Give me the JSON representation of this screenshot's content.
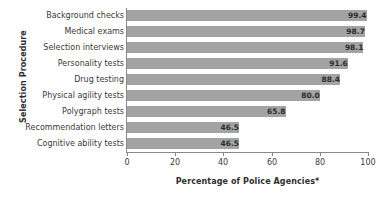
{
  "chart_data": {
    "type": "bar",
    "orientation": "horizontal",
    "title": "",
    "xlabel": "Percentage of Police Agencies*",
    "ylabel": "Selection Procedure",
    "xlim": [
      0,
      100
    ],
    "xticks": [
      "0",
      "20",
      "40",
      "60",
      "80",
      "100"
    ],
    "xtick_values": [
      0,
      20,
      40,
      60,
      80,
      100
    ],
    "grid": false,
    "legend": null,
    "bar_color": "#a3a3a3",
    "axis_color": "#888888",
    "categories": [
      "Background checks",
      "Medical exams",
      "Selection interviews",
      "Personality tests",
      "Drug testing",
      "Physical agility tests",
      "Polygraph tests",
      "Recommendation letters",
      "Cognitive ability tests"
    ],
    "values": [
      99.4,
      98.7,
      98.1,
      91.6,
      88.4,
      80.0,
      65.8,
      46.5,
      46.5
    ],
    "value_labels": [
      "99.4",
      "98.7",
      "98.1",
      "91.6",
      "88.4",
      "80.0",
      "65.8",
      "46.5",
      "46.5"
    ]
  }
}
